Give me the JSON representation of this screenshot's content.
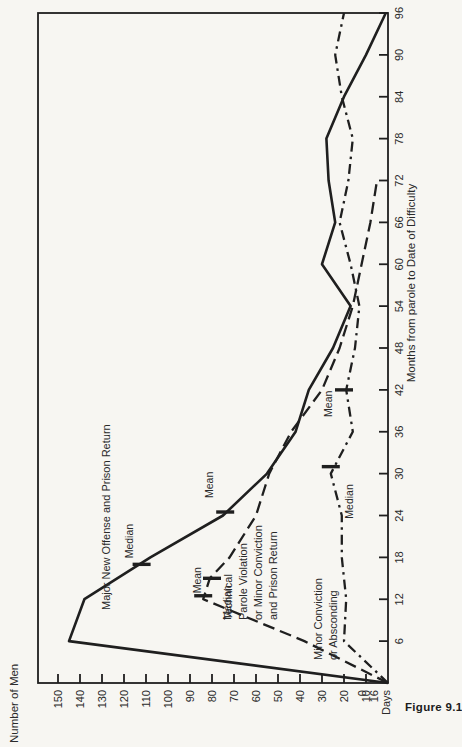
{
  "figure": {
    "caption_fragment": "Figure 9.1",
    "ink_color": "#1f1f1f",
    "paper_color": "#f7f6f2"
  },
  "chart_data": {
    "type": "line",
    "orientation_note": "landscape chart rotated 90deg CCW on portrait page",
    "xlabel": "Months from parole to Date of Difficulty",
    "ylabel": "Number of Men",
    "xlim": [
      0,
      96
    ],
    "ylim": [
      0,
      150
    ],
    "x_ticks": [
      6,
      12,
      18,
      24,
      30,
      36,
      42,
      48,
      54,
      60,
      66,
      72,
      78,
      84,
      90,
      96
    ],
    "y_ticks": [
      10,
      20,
      30,
      40,
      50,
      60,
      70,
      80,
      90,
      100,
      110,
      120,
      130,
      140,
      150
    ],
    "origin_labels": [
      "0",
      "16",
      "Days"
    ],
    "grid": false,
    "legend_position": "labels drawn along curves",
    "series": [
      {
        "name": "Major New Offense and Prison Return",
        "style": "solid",
        "points": [
          [
            0,
            0
          ],
          [
            6,
            145
          ],
          [
            12,
            138
          ],
          [
            18,
            108
          ],
          [
            24,
            75
          ],
          [
            30,
            55
          ],
          [
            36,
            42
          ],
          [
            42,
            36
          ],
          [
            48,
            25
          ],
          [
            54,
            17
          ],
          [
            60,
            30
          ],
          [
            66,
            24
          ],
          [
            72,
            27
          ],
          [
            78,
            28
          ],
          [
            84,
            20
          ],
          [
            90,
            10
          ],
          [
            96,
            1
          ]
        ],
        "label_lines": [
          "Major New Offense and Prison Return"
        ],
        "label_anchor_px": [
          137,
          110
        ],
        "markers": [
          {
            "label": "Median",
            "month": 17,
            "value": 112,
            "label_dx": 6,
            "label_dy": -9
          },
          {
            "label": "Mean",
            "month": 24.5,
            "value": 74,
            "label_dx": 14,
            "label_dy": -12
          }
        ]
      },
      {
        "name": "Technical Parole Violation or Minor Conviction and Prison Return",
        "style": "dashed",
        "points": [
          [
            0,
            0
          ],
          [
            6,
            38
          ],
          [
            12,
            84
          ],
          [
            15,
            81
          ],
          [
            18,
            72
          ],
          [
            24,
            60
          ],
          [
            30,
            54
          ],
          [
            36,
            44
          ],
          [
            42,
            30
          ],
          [
            48,
            22
          ],
          [
            54,
            16
          ],
          [
            60,
            12
          ],
          [
            66,
            8
          ],
          [
            72,
            5
          ]
        ],
        "label_lines": [
          "Technical",
          "Parole Violation",
          "or Minor Conviction",
          "and Prison Return"
        ],
        "label_anchor_px": [
          127,
          232
        ],
        "markers": [
          {
            "label": "Median",
            "month": 12.5,
            "value": 84,
            "label_dx": -24,
            "label_dy": 28
          },
          {
            "label": "Mean",
            "month": 15,
            "value": 80,
            "label_dx": -15,
            "label_dy": -11
          }
        ]
      },
      {
        "name": "Minor Conviction or Absconding",
        "style": "dashdot",
        "points": [
          [
            0,
            0
          ],
          [
            6,
            20
          ],
          [
            12,
            19
          ],
          [
            18,
            21
          ],
          [
            24,
            21
          ],
          [
            30,
            26
          ],
          [
            36,
            16
          ],
          [
            42,
            19
          ],
          [
            48,
            15
          ],
          [
            54,
            13
          ],
          [
            60,
            17
          ],
          [
            66,
            22
          ],
          [
            72,
            18
          ],
          [
            78,
            16
          ],
          [
            84,
            21
          ],
          [
            90,
            24
          ],
          [
            96,
            20
          ]
        ],
        "label_lines": [
          "Minor Conviction",
          "or Absconding"
        ],
        "label_anchor_px": [
          87,
          322
        ],
        "markers": [
          {
            "label": "Median",
            "month": 31,
            "value": 26,
            "label_dx": -52,
            "label_dy": 22
          },
          {
            "label": "Mean",
            "month": 42,
            "value": 20,
            "label_dx": -27,
            "label_dy": -12
          }
        ]
      }
    ]
  }
}
